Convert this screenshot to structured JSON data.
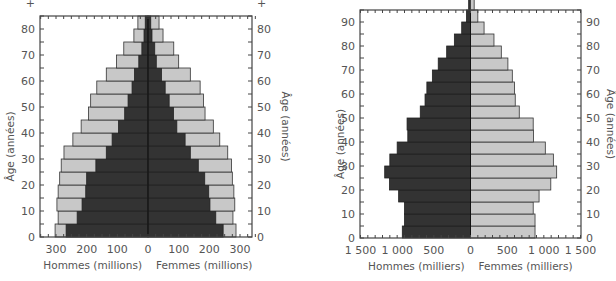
{
  "chart_data": [
    {
      "type": "bar",
      "subtype": "population-pyramid-stacked",
      "title": "",
      "xlabel_left": "Hommes (millions)",
      "xlabel_right": "Femmes (millions)",
      "ylabel": "Âge (années)",
      "ylabel_right": "Âge (années)",
      "x_ticks": [
        "300",
        "200",
        "100",
        "0",
        "100",
        "200",
        "300"
      ],
      "y_ticks": [
        "0",
        "10",
        "20",
        "30",
        "40",
        "50",
        "60",
        "70",
        "80",
        "+"
      ],
      "xlim": [
        -350,
        350
      ],
      "ylim": [
        0,
        85
      ],
      "age_groups": [
        "0-4",
        "5-9",
        "10-14",
        "15-19",
        "20-24",
        "25-29",
        "30-34",
        "35-39",
        "40-44",
        "45-49",
        "50-54",
        "55-59",
        "60-64",
        "65-69",
        "70-74",
        "75-79",
        "80+"
      ],
      "series": [
        {
          "name": "Hommes (population totale)",
          "color": "#c8c8c8",
          "values": [
            303,
            293,
            297,
            293,
            288,
            283,
            274,
            245,
            218,
            194,
            187,
            167,
            136,
            103,
            79,
            46,
            33
          ]
        },
        {
          "name": "Hommes (sous-population)",
          "color": "#333333",
          "values": [
            267,
            231,
            215,
            203,
            200,
            170,
            136,
            117,
            96,
            76,
            65,
            52,
            44,
            30,
            20,
            13,
            9
          ]
        },
        {
          "name": "Femmes (population totale)",
          "color": "#c8c8c8",
          "values": [
            287,
            277,
            283,
            280,
            275,
            272,
            260,
            234,
            213,
            186,
            181,
            170,
            138,
            100,
            84,
            49,
            36
          ]
        },
        {
          "name": "Femmes (sous-population)",
          "color": "#333333",
          "values": [
            245,
            221,
            202,
            198,
            185,
            164,
            138,
            121,
            94,
            83,
            69,
            56,
            44,
            27,
            22,
            13,
            9
          ]
        }
      ],
      "grid": false,
      "legend": "none"
    },
    {
      "type": "bar",
      "subtype": "population-pyramid",
      "title": "",
      "xlabel_left": "Hommes (milliers)",
      "xlabel_right": "Femmes (milliers)",
      "ylabel": "Âge (années)",
      "ylabel_right": "Âge (années)",
      "x_ticks": [
        "1 500",
        "1 000",
        "500",
        "0",
        "500",
        "1 000",
        "1 500"
      ],
      "y_ticks": [
        "0",
        "10",
        "20",
        "30",
        "40",
        "50",
        "60",
        "70",
        "80",
        "90"
      ],
      "xlim": [
        -1500,
        1500
      ],
      "ylim": [
        0,
        95
      ],
      "age_groups": [
        "0-4",
        "5-9",
        "10-14",
        "15-19",
        "20-24",
        "25-29",
        "30-34",
        "35-39",
        "40-44",
        "45-49",
        "50-54",
        "55-59",
        "60-64",
        "65-69",
        "70-74",
        "75-79",
        "80-84",
        "85-89",
        "90-94",
        "95+"
      ],
      "series": [
        {
          "name": "Hommes",
          "color": "#333333",
          "values": [
            930,
            900,
            900,
            980,
            1105,
            1170,
            1100,
            1000,
            855,
            865,
            685,
            620,
            595,
            520,
            440,
            325,
            220,
            120,
            55,
            25
          ]
        },
        {
          "name": "Femmes",
          "color": "#c8c8c8",
          "values": [
            880,
            880,
            855,
            935,
            1095,
            1175,
            1130,
            1020,
            860,
            855,
            665,
            610,
            600,
            570,
            510,
            420,
            320,
            185,
            100,
            50
          ]
        }
      ],
      "grid": false,
      "legend": "none"
    }
  ]
}
